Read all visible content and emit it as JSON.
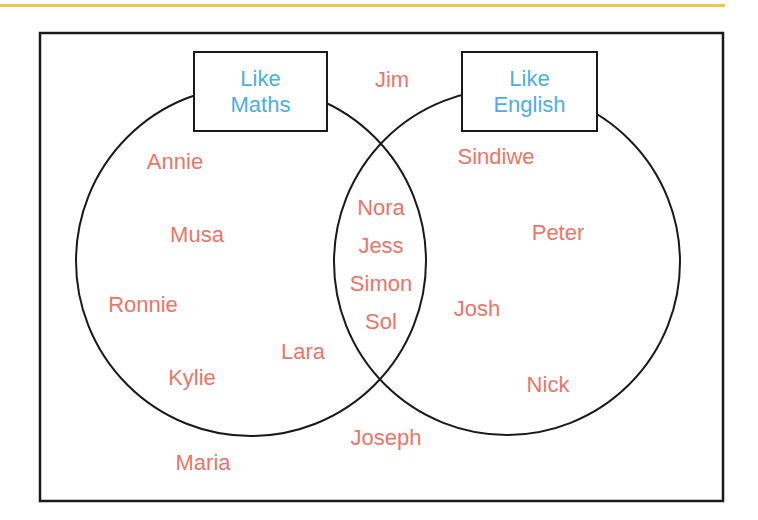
{
  "header": {
    "rule_color": "#ECC84A"
  },
  "diagram": {
    "type": "venn",
    "sets": [
      {
        "id": "maths",
        "label_line1": "Like",
        "label_line2": "Maths"
      },
      {
        "id": "english",
        "label_line1": "Like",
        "label_line2": "English"
      }
    ],
    "regions": {
      "maths_only": [
        "Annie",
        "Musa",
        "Ronnie",
        "Kylie",
        "Lara"
      ],
      "both": [
        "Nora",
        "Jess",
        "Simon",
        "Sol"
      ],
      "english_only": [
        "Sindiwe",
        "Peter",
        "Josh",
        "Nick"
      ],
      "neither": [
        "Jim",
        "Joseph",
        "Maria"
      ]
    },
    "colors": {
      "names": "#EE7468",
      "set_labels": "#4BAEE8",
      "lines": "#1a1a1a"
    }
  }
}
